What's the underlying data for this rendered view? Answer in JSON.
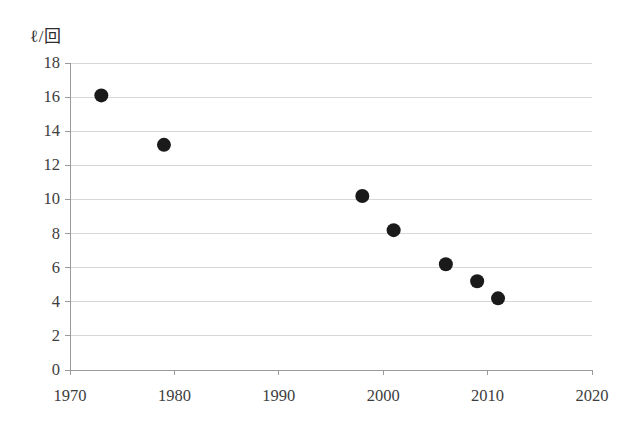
{
  "chart_data": {
    "type": "scatter",
    "title": "",
    "subtitle": "",
    "xlabel": "",
    "ylabel": "ℓ／回",
    "ylabel_display": "ℓ/回",
    "xlim": [
      1970,
      2020
    ],
    "ylim": [
      0,
      18
    ],
    "x_ticks": [
      1970,
      1980,
      1990,
      2000,
      2010,
      2020
    ],
    "x_tick_labels": [
      "1970",
      "1980",
      "1990",
      "2000",
      "2010",
      "2020"
    ],
    "y_ticks": [
      0,
      2,
      4,
      6,
      8,
      10,
      12,
      14,
      16,
      18
    ],
    "y_tick_labels": [
      "0",
      "2",
      "4",
      "6",
      "8",
      "10",
      "12",
      "14",
      "16",
      "18"
    ],
    "grid": {
      "horizontal": true,
      "vertical": false,
      "color": "#d8d8d8"
    },
    "legend": {
      "visible": false,
      "position": "none",
      "entries": []
    },
    "marker": {
      "shape": "circle",
      "color": "#1a1a1a",
      "size_px": 14
    },
    "axis_line_color": "#9a9a9a",
    "series": [
      {
        "name": "",
        "x": [
          1973,
          1979,
          1998,
          2001,
          2006,
          2009,
          2011
        ],
        "y": [
          16.1,
          13.2,
          10.2,
          8.2,
          6.2,
          5.2,
          4.2
        ],
        "points": [
          {
            "x": 1973,
            "y": 16.1
          },
          {
            "x": 1979,
            "y": 13.2
          },
          {
            "x": 1998,
            "y": 10.2
          },
          {
            "x": 2001,
            "y": 8.2
          },
          {
            "x": 2006,
            "y": 6.2
          },
          {
            "x": 2009,
            "y": 5.2
          },
          {
            "x": 2011,
            "y": 4.2
          }
        ]
      }
    ],
    "annotations": []
  }
}
